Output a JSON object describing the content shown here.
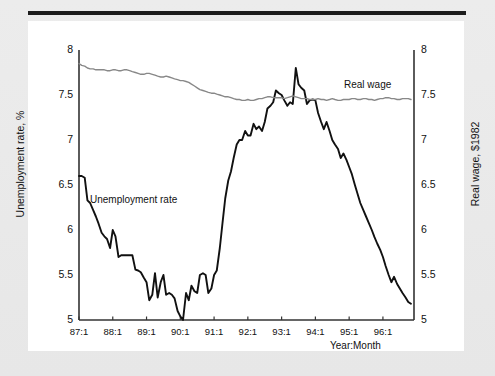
{
  "figure": {
    "background_color": "#e9e9e9",
    "card_color": "#ffffff",
    "rule_color": "#1c1c1c"
  },
  "chart_data": {
    "type": "line",
    "title": "",
    "xlabel": "Year:Month",
    "ylabel": "Unemployment rate, %",
    "y2label": "Real wage, $1982",
    "ylim": [
      5,
      8
    ],
    "y2lim": [
      5,
      8
    ],
    "yticks": [
      "5",
      "5.5",
      "6",
      "6.5",
      "7",
      "7.5",
      "8"
    ],
    "ytick_values": [
      5,
      5.5,
      6,
      6.5,
      7,
      7.5,
      8
    ],
    "y2ticks": [
      "5",
      "5.5",
      "6",
      "6.5",
      "7",
      "7.5",
      "8"
    ],
    "xticks": [
      "87:1",
      "88:1",
      "89:1",
      "90:1",
      "91:1",
      "92:1",
      "93:1",
      "94:1",
      "95:1",
      "96:1"
    ],
    "xtick_values": [
      1987,
      1988,
      1989,
      1990,
      1991,
      1992,
      1993,
      1994,
      1995,
      1996
    ],
    "xlim": [
      1987.0,
      1996.92
    ],
    "grid": false,
    "legend_position": "inline-annotations",
    "series": [
      {
        "name": "Unemployment rate",
        "axis": "left",
        "color": "#111111",
        "width": 1.9,
        "annotation": "Unemployment rate",
        "x": [
          1987.0,
          1987.08,
          1987.17,
          1987.25,
          1987.33,
          1987.42,
          1987.5,
          1987.58,
          1987.67,
          1987.75,
          1987.83,
          1987.92,
          1988.0,
          1988.08,
          1988.17,
          1988.25,
          1988.33,
          1988.42,
          1988.5,
          1988.58,
          1988.67,
          1988.75,
          1988.83,
          1988.92,
          1989.0,
          1989.08,
          1989.17,
          1989.25,
          1989.33,
          1989.42,
          1989.5,
          1989.58,
          1989.67,
          1989.75,
          1989.83,
          1989.92,
          1990.0,
          1990.08,
          1990.17,
          1990.25,
          1990.33,
          1990.42,
          1990.5,
          1990.58,
          1990.67,
          1990.75,
          1990.83,
          1990.92,
          1991.0,
          1991.08,
          1991.17,
          1991.25,
          1991.33,
          1991.42,
          1991.5,
          1991.58,
          1991.67,
          1991.75,
          1991.83,
          1991.92,
          1992.0,
          1992.08,
          1992.17,
          1992.25,
          1992.33,
          1992.42,
          1992.5,
          1992.58,
          1992.67,
          1992.75,
          1992.83,
          1992.92,
          1993.0,
          1993.08,
          1993.17,
          1993.25,
          1993.33,
          1993.42,
          1993.5,
          1993.58,
          1993.67,
          1993.75,
          1993.83,
          1993.92,
          1994.0,
          1994.08,
          1994.17,
          1994.25,
          1994.33,
          1994.42,
          1994.5,
          1994.58,
          1994.67,
          1994.75,
          1994.83,
          1994.92,
          1995.0,
          1995.08,
          1995.17,
          1995.25,
          1995.33,
          1995.42,
          1995.5,
          1995.58,
          1995.67,
          1995.75,
          1995.83,
          1995.92,
          1996.0,
          1996.08,
          1996.17,
          1996.25,
          1996.33,
          1996.42,
          1996.5,
          1996.58,
          1996.67,
          1996.75,
          1996.83
        ],
        "values": [
          6.6,
          6.6,
          6.58,
          6.33,
          6.3,
          6.22,
          6.15,
          6.07,
          5.97,
          5.93,
          5.9,
          5.8,
          6.0,
          5.93,
          5.7,
          5.72,
          5.72,
          5.72,
          5.72,
          5.72,
          5.56,
          5.55,
          5.53,
          5.47,
          5.42,
          5.22,
          5.28,
          5.52,
          5.25,
          5.42,
          5.5,
          5.28,
          5.3,
          5.28,
          5.24,
          5.1,
          5.04,
          5.0,
          5.3,
          5.22,
          5.38,
          5.32,
          5.3,
          5.5,
          5.52,
          5.5,
          5.3,
          5.35,
          5.5,
          5.55,
          5.8,
          6.08,
          6.35,
          6.55,
          6.65,
          6.8,
          6.95,
          7.0,
          7.0,
          7.1,
          7.05,
          7.05,
          7.18,
          7.12,
          7.15,
          7.1,
          7.2,
          7.35,
          7.38,
          7.42,
          7.55,
          7.52,
          7.5,
          7.44,
          7.38,
          7.42,
          7.4,
          7.8,
          7.62,
          7.58,
          7.55,
          7.4,
          7.44,
          7.45,
          7.44,
          7.3,
          7.2,
          7.12,
          7.2,
          7.1,
          7.0,
          6.95,
          6.9,
          6.8,
          6.85,
          6.78,
          6.7,
          6.62,
          6.5,
          6.4,
          6.3,
          6.22,
          6.15,
          6.08,
          6.0,
          5.92,
          5.85,
          5.78,
          5.7,
          5.6,
          5.5,
          5.42,
          5.48,
          5.4,
          5.35,
          5.3,
          5.25,
          5.2,
          5.18
        ]
      },
      {
        "name": "Real wage",
        "axis": "right",
        "color": "#888888",
        "width": 1.4,
        "annotation": "Real wage",
        "values_start": 7.85,
        "values_end": 7.45,
        "values": [
          7.85,
          7.83,
          7.82,
          7.8,
          7.79,
          7.79,
          7.78,
          7.78,
          7.78,
          7.78,
          7.77,
          7.77,
          7.78,
          7.78,
          7.77,
          7.77,
          7.78,
          7.78,
          7.77,
          7.76,
          7.75,
          7.74,
          7.73,
          7.73,
          7.74,
          7.74,
          7.73,
          7.72,
          7.71,
          7.7,
          7.7,
          7.71,
          7.7,
          7.69,
          7.68,
          7.67,
          7.66,
          7.66,
          7.65,
          7.64,
          7.62,
          7.6,
          7.58,
          7.56,
          7.55,
          7.54,
          7.53,
          7.52,
          7.52,
          7.51,
          7.5,
          7.49,
          7.48,
          7.48,
          7.47,
          7.46,
          7.45,
          7.45,
          7.44,
          7.44,
          7.45,
          7.44,
          7.44,
          7.45,
          7.46,
          7.46,
          7.47,
          7.48,
          7.48,
          7.47,
          7.47,
          7.47,
          7.47,
          7.46,
          7.47,
          7.48,
          7.49,
          7.48,
          7.47,
          7.46,
          7.46,
          7.46,
          7.45,
          7.45,
          7.45,
          7.46,
          7.45,
          7.45,
          7.44,
          7.45,
          7.46,
          7.45,
          7.44,
          7.44,
          7.45,
          7.45,
          7.45,
          7.46,
          7.46,
          7.45,
          7.45,
          7.46,
          7.46,
          7.45,
          7.45,
          7.44,
          7.45,
          7.46,
          7.46,
          7.47,
          7.47,
          7.46,
          7.46,
          7.45,
          7.45,
          7.46,
          7.46,
          7.46,
          7.45
        ]
      }
    ]
  }
}
